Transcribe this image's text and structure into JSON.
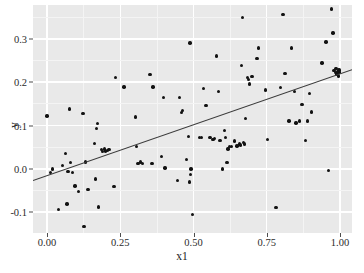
{
  "chart_data": {
    "type": "scatter",
    "title": "",
    "xlabel": "x1",
    "ylabel": "y",
    "xlim": [
      -0.048,
      1.041
    ],
    "ylim": [
      -0.148,
      0.378
    ],
    "xticks": [
      0.0,
      0.25,
      0.5,
      0.75,
      1.0
    ],
    "xtick_labels": [
      "0.00",
      "0.25",
      "0.50",
      "0.75",
      "1.00"
    ],
    "yticks": [
      -0.1,
      0.0,
      0.1,
      0.2,
      0.3
    ],
    "ytick_labels": [
      "-0.1",
      "0.0",
      "0.1",
      "0.2",
      "0.3"
    ],
    "grid": true,
    "grid_color": "#ffffff",
    "panel_background": "#e9e9e9",
    "point_color": "#121212",
    "line_color": "#3a3a3a",
    "legend": null,
    "fit_line": {
      "type": "linear",
      "intercept": -0.0155,
      "slope": 0.2345,
      "x_start": -0.048,
      "x_end": 1.041,
      "y_start": -0.0268,
      "y_end": 0.2286
    },
    "n_points": 112,
    "points": [
      [
        0.0,
        0.122
      ],
      [
        0.012,
        -0.009
      ],
      [
        0.018,
        0.0
      ],
      [
        0.04,
        -0.094
      ],
      [
        0.052,
        0.008
      ],
      [
        0.062,
        0.035
      ],
      [
        0.068,
        -0.081
      ],
      [
        0.072,
        -0.006
      ],
      [
        0.076,
        0.138
      ],
      [
        0.08,
        0.014
      ],
      [
        0.086,
        -0.008
      ],
      [
        0.096,
        -0.04
      ],
      [
        0.108,
        -0.052
      ],
      [
        0.122,
        0.128
      ],
      [
        0.126,
        -0.133
      ],
      [
        0.132,
        0.016
      ],
      [
        0.14,
        -0.047
      ],
      [
        0.162,
        0.059
      ],
      [
        0.166,
        -0.023
      ],
      [
        0.168,
        0.093
      ],
      [
        0.172,
        0.105
      ],
      [
        0.176,
        -0.088
      ],
      [
        0.186,
        0.044
      ],
      [
        0.19,
        0.04
      ],
      [
        0.196,
        0.046
      ],
      [
        0.2,
        0.041
      ],
      [
        0.206,
        0.042
      ],
      [
        0.212,
        0.045
      ],
      [
        0.228,
        -0.041
      ],
      [
        0.234,
        0.211
      ],
      [
        0.262,
        0.189
      ],
      [
        0.302,
        0.12
      ],
      [
        0.306,
        0.052
      ],
      [
        0.31,
        0.013
      ],
      [
        0.318,
        0.016
      ],
      [
        0.326,
        0.012
      ],
      [
        0.352,
        0.218
      ],
      [
        0.358,
        0.013
      ],
      [
        0.362,
        0.189
      ],
      [
        0.39,
        0.028
      ],
      [
        0.398,
        0.164
      ],
      [
        0.402,
        0.002
      ],
      [
        0.446,
        -0.027
      ],
      [
        0.452,
        0.165
      ],
      [
        0.458,
        0.13
      ],
      [
        0.462,
        0.135
      ],
      [
        0.476,
        0.022
      ],
      [
        0.482,
        0.074
      ],
      [
        0.486,
        -0.03
      ],
      [
        0.488,
        0.29
      ],
      [
        0.49,
        -0.013
      ],
      [
        0.492,
        0.0
      ],
      [
        0.496,
        -0.106
      ],
      [
        0.52,
        0.072
      ],
      [
        0.528,
        0.073
      ],
      [
        0.534,
        0.186
      ],
      [
        0.542,
        0.146
      ],
      [
        0.556,
        0.072
      ],
      [
        0.566,
        0.068
      ],
      [
        0.572,
        0.07
      ],
      [
        0.578,
        0.26
      ],
      [
        0.586,
        0.179
      ],
      [
        0.59,
        0.066
      ],
      [
        0.598,
        0.0
      ],
      [
        0.606,
        0.088
      ],
      [
        0.61,
        0.072
      ],
      [
        0.614,
        0.014
      ],
      [
        0.618,
        0.046
      ],
      [
        0.622,
        0.052
      ],
      [
        0.63,
        0.051
      ],
      [
        0.64,
        0.064
      ],
      [
        0.648,
        0.053
      ],
      [
        0.656,
        0.057
      ],
      [
        0.66,
        0.055
      ],
      [
        0.664,
        0.239
      ],
      [
        0.668,
        0.349
      ],
      [
        0.67,
        0.061
      ],
      [
        0.674,
        0.057
      ],
      [
        0.678,
        0.116
      ],
      [
        0.684,
        0.211
      ],
      [
        0.688,
        0.206
      ],
      [
        0.692,
        0.196
      ],
      [
        0.7,
        0.213
      ],
      [
        0.716,
        0.255
      ],
      [
        0.722,
        0.279
      ],
      [
        0.746,
        0.182
      ],
      [
        0.752,
        0.068
      ],
      [
        0.782,
        -0.089
      ],
      [
        0.796,
        0.188
      ],
      [
        0.806,
        0.356
      ],
      [
        0.812,
        0.22
      ],
      [
        0.826,
        0.11
      ],
      [
        0.834,
        0.279
      ],
      [
        0.844,
        0.178
      ],
      [
        0.85,
        0.106
      ],
      [
        0.862,
        0.11
      ],
      [
        0.87,
        0.148
      ],
      [
        0.882,
        0.066
      ],
      [
        0.89,
        0.11
      ],
      [
        0.896,
        0.174
      ],
      [
        0.902,
        0.131
      ],
      [
        0.938,
        0.244
      ],
      [
        0.952,
        0.293
      ],
      [
        0.96,
        -0.004
      ],
      [
        0.972,
        0.369
      ],
      [
        0.976,
        0.313
      ],
      [
        0.98,
        0.227
      ],
      [
        0.984,
        0.222
      ],
      [
        0.986,
        0.231
      ],
      [
        0.99,
        0.219
      ],
      [
        0.992,
        0.225
      ],
      [
        0.994,
        0.214
      ],
      [
        0.996,
        0.228
      ],
      [
        0.998,
        0.223
      ]
    ]
  }
}
